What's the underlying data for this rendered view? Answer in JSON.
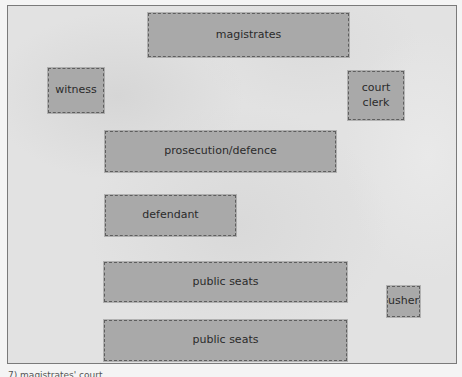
{
  "diagram": {
    "type": "courtroom-layout",
    "boxes": {
      "magistrates": "magistrates",
      "witness": "witness",
      "court_clerk_line1": "court",
      "court_clerk_line2": "clerk",
      "prosecution_defence": "prosecution/defence",
      "defendant": "defendant",
      "public_seats_1": "public seats",
      "public_seats_2": "public seats",
      "usher": "usher"
    },
    "caption": "7) magistrates' court"
  },
  "colors": {
    "box_fill": "#a9a9a9",
    "background": "#e2e2e2",
    "border": "#7a7a7a"
  }
}
